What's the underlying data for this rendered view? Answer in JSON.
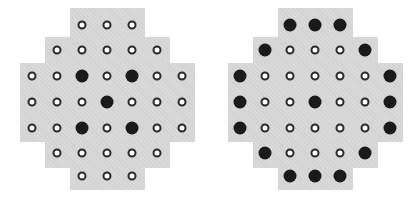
{
  "colors": {
    "board": "#d9d9d9",
    "peg": "#1a1a1a",
    "hole": "#ffffff"
  },
  "boards": [
    {
      "name": "left-board",
      "left": 0,
      "grid": [
        "  ooo  ",
        " ooooo ",
        "oo#o#oo",
        "ooo#ooo",
        "oo#o#oo",
        " ooooo ",
        "  ooo  "
      ]
    },
    {
      "name": "right-board",
      "left": 208,
      "grid": [
        "  ###  ",
        " #ooo# ",
        "#ooooo#",
        "#oo#oo#",
        "#ooooo#",
        " #ooo# ",
        "  ###  "
      ]
    }
  ]
}
